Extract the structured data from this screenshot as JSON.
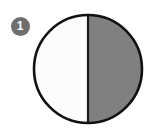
{
  "figure": {
    "background_color": "#ffffff",
    "badge": {
      "label": "1",
      "shape": "circle",
      "fill_color": "#6e6e6e",
      "text_color": "#ffffff",
      "diameter_px": 19,
      "center_x": 20,
      "center_y": 26
    },
    "diagram": {
      "name": "half-shaded-circle",
      "type": "fraction-circle",
      "shape": "circle",
      "center_x": 88,
      "center_y": 69,
      "radius_px": 54,
      "outline_color": "#111111",
      "outline_width_px": 2,
      "divider": {
        "orientation": "vertical",
        "count": 1,
        "color": "#1a1a1a",
        "width_px": 2,
        "position_x": 88
      },
      "parts_total": 2,
      "parts_shaded": 1,
      "fraction_label": "1/2",
      "percent_shaded": 50,
      "sectors": [
        {
          "name": "left-half",
          "state": "unshaded",
          "fill_color": "#fcfcfc",
          "start_angle_deg": 90,
          "end_angle_deg": 270
        },
        {
          "name": "right-half",
          "state": "shaded",
          "fill_color": "#808080",
          "start_angle_deg": 270,
          "end_angle_deg": 450
        }
      ]
    }
  }
}
